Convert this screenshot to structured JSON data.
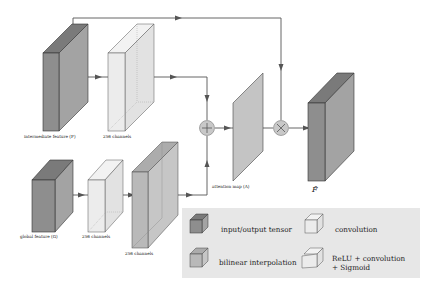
{
  "diagram": {
    "nodes": {
      "intermediate_feature": {
        "label": "intermediate feature (F)",
        "kind": "input/output tensor"
      },
      "conv_top": {
        "label": "256 channels",
        "kind": "convolution"
      },
      "global_feature": {
        "label": "global feature (G)",
        "kind": "input/output tensor"
      },
      "conv_bottom_1": {
        "label": "256 channels",
        "kind": "convolution"
      },
      "interp_bottom": {
        "label": "256 channels",
        "kind": "bilinear interpolation"
      },
      "add_op": {
        "symbol": "+",
        "kind": "element-wise addition"
      },
      "attention_map": {
        "label": "attention map (A)",
        "kind": "ReLU + convolution + Sigmoid"
      },
      "mul_op": {
        "symbol": "×",
        "kind": "element-wise multiplication"
      },
      "output": {
        "label": "F̂",
        "kind": "input/output tensor"
      }
    },
    "edges": [
      [
        "intermediate_feature",
        "conv_top"
      ],
      [
        "conv_top",
        "add_op"
      ],
      [
        "global_feature",
        "conv_bottom_1"
      ],
      [
        "conv_bottom_1",
        "interp_bottom"
      ],
      [
        "interp_bottom",
        "add_op"
      ],
      [
        "add_op",
        "attention_map"
      ],
      [
        "attention_map",
        "mul_op"
      ],
      [
        "intermediate_feature",
        "mul_op"
      ],
      [
        "mul_op",
        "output"
      ]
    ],
    "legend": [
      {
        "label": "input/output tensor",
        "swatch": "dark"
      },
      {
        "label": "convolution",
        "swatch": "light"
      },
      {
        "label": "bilinear interpolation",
        "swatch": "mid"
      },
      {
        "label": "ReLU + convolution",
        "label2": "+ Sigmoid",
        "swatch": "light-slanted"
      }
    ],
    "colors": {
      "dark_front": "#8e8e8e",
      "dark_side": "#a3a3a3",
      "dark_top": "#7a7a7a",
      "light_front": "#ececec",
      "light_side": "#e2e2e2",
      "light_top": "#f2f2f2",
      "mid_front": "#b9b9b9",
      "mid_side": "#c6c6c6",
      "mid_top": "#acacac",
      "attention": "#c4c4c4",
      "op_circle": "#c8c8c8",
      "legend_bg": "#e7e7e7",
      "edge": "#555555"
    }
  }
}
